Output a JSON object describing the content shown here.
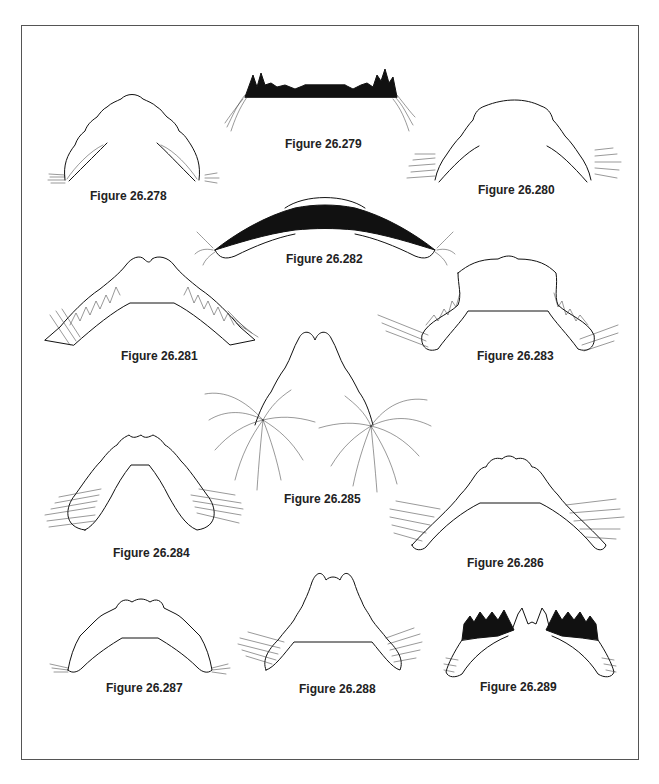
{
  "page": {
    "type": "scientific plate"
  },
  "figures": [
    {
      "id": "278",
      "caption": "Figure 26.278"
    },
    {
      "id": "279",
      "caption": "Figure 26.279"
    },
    {
      "id": "280",
      "caption": "Figure 26.280"
    },
    {
      "id": "281",
      "caption": "Figure 26.281"
    },
    {
      "id": "282",
      "caption": "Figure 26.282"
    },
    {
      "id": "283",
      "caption": "Figure 26.283"
    },
    {
      "id": "284",
      "caption": "Figure 26.284"
    },
    {
      "id": "285",
      "caption": "Figure 26.285"
    },
    {
      "id": "286",
      "caption": "Figure 26.286"
    },
    {
      "id": "287",
      "caption": "Figure 26.287"
    },
    {
      "id": "288",
      "caption": "Figure 26.288"
    },
    {
      "id": "289",
      "caption": "Figure 26.289"
    }
  ]
}
